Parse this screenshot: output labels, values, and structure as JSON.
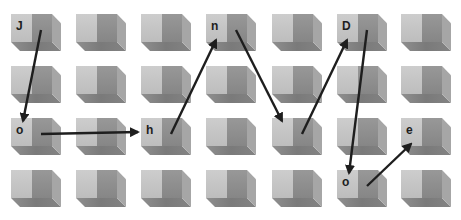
{
  "diagram": {
    "type": "grid-path",
    "rows": 4,
    "cols": 7,
    "colors": {
      "background": "#ffffff",
      "cube_front": "#c4c4c4",
      "cube_side": "#8e8e8e",
      "arrow": "#1e1e1e",
      "letter": "#1e1e1e"
    },
    "cells": [
      {
        "row": 0,
        "col": 0,
        "label": "J"
      },
      {
        "row": 0,
        "col": 3,
        "label": "n"
      },
      {
        "row": 0,
        "col": 5,
        "label": "D"
      },
      {
        "row": 2,
        "col": 0,
        "label": "o"
      },
      {
        "row": 2,
        "col": 2,
        "label": "h"
      },
      {
        "row": 2,
        "col": 6,
        "label": "e"
      },
      {
        "row": 3,
        "col": 5,
        "label": "o"
      }
    ],
    "path": [
      {
        "from": [
          0,
          0
        ],
        "to": [
          2,
          0
        ]
      },
      {
        "from": [
          2,
          0
        ],
        "to": [
          2,
          2
        ]
      },
      {
        "from": [
          2,
          2
        ],
        "to": [
          0,
          3
        ]
      },
      {
        "from": [
          0,
          3
        ],
        "to": [
          2,
          4
        ]
      },
      {
        "from": [
          2,
          4
        ],
        "to": [
          0,
          5
        ]
      },
      {
        "from": [
          0,
          5
        ],
        "to": [
          3,
          5
        ]
      },
      {
        "from": [
          3,
          5
        ],
        "to": [
          2,
          6
        ]
      }
    ],
    "spelled_word": "JohnDoe"
  }
}
